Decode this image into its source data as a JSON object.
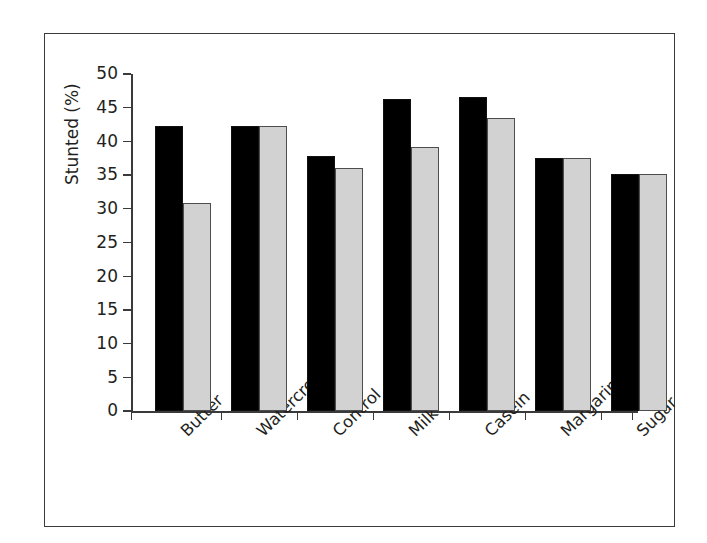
{
  "chart_data": {
    "type": "bar",
    "title": "",
    "xlabel": "",
    "ylabel": "Stunted (%)",
    "categories": [
      "Butter",
      "Watercress",
      "Control",
      "Milk",
      "Casein",
      "Margarine",
      "Sugar"
    ],
    "series": [
      {
        "name": "series-1-black",
        "color": "#000000",
        "values": [
          42.3,
          42.3,
          37.9,
          46.3,
          46.6,
          37.6,
          35.1
        ]
      },
      {
        "name": "series-2-grey",
        "color": "#d2d2d2",
        "values": [
          30.8,
          42.3,
          36.0,
          39.1,
          43.4,
          37.6,
          35.1
        ]
      }
    ],
    "ylim": [
      0,
      50
    ],
    "yticks": [
      0,
      5,
      10,
      15,
      20,
      25,
      30,
      35,
      40,
      45,
      50
    ],
    "ytick_labels": [
      "0",
      "5",
      "10",
      "15",
      "20",
      "25",
      "30",
      "35",
      "40",
      "45",
      "50"
    ],
    "grid": false,
    "legend": null,
    "legend_position": "none",
    "frame": true
  }
}
